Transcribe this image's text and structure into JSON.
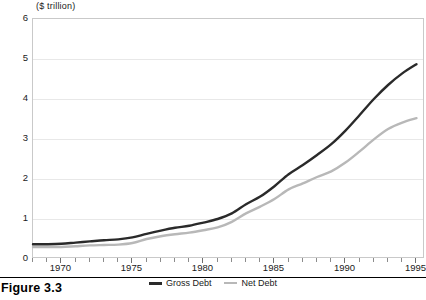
{
  "caption": "Figure 3.3",
  "chart_data": {
    "type": "line",
    "title": "",
    "subtitle": "",
    "xlabel": "",
    "ylabel": "($ trillion)",
    "y_unit_label": "($ trillion)",
    "xlim": [
      1968,
      1995.6
    ],
    "ylim": [
      0,
      6
    ],
    "y_ticks": [
      0,
      1,
      2,
      3,
      4,
      5,
      6
    ],
    "y_tick_labels": [
      "0",
      "1",
      "2",
      "3",
      "4",
      "5",
      "6"
    ],
    "x_ticks": [
      1970,
      1975,
      1980,
      1985,
      1990,
      1995
    ],
    "x_tick_labels": [
      "1970",
      "1975",
      "1980",
      "1985",
      "1990",
      "1995"
    ],
    "x_minor_tick_step": 1,
    "grid": "horizontal",
    "legend_position": "bottom-center",
    "x": [
      1968,
      1969,
      1970,
      1971,
      1972,
      1973,
      1974,
      1975,
      1976,
      1977,
      1978,
      1979,
      1980,
      1981,
      1982,
      1983,
      1984,
      1985,
      1986,
      1987,
      1988,
      1989,
      1990,
      1991,
      1992,
      1993,
      1994,
      1995
    ],
    "series": [
      {
        "name": "Gross Debt",
        "color": "#2a2a2a",
        "width": 2.4,
        "values": [
          0.37,
          0.37,
          0.38,
          0.41,
          0.44,
          0.47,
          0.49,
          0.54,
          0.63,
          0.71,
          0.78,
          0.83,
          0.91,
          1.0,
          1.14,
          1.37,
          1.56,
          1.82,
          2.12,
          2.35,
          2.6,
          2.87,
          3.21,
          3.6,
          4.0,
          4.35,
          4.64,
          4.87
        ]
      },
      {
        "name": "Net Debt",
        "color": "#b8b8b8",
        "width": 2.4,
        "values": [
          0.3,
          0.3,
          0.3,
          0.32,
          0.34,
          0.35,
          0.36,
          0.4,
          0.5,
          0.57,
          0.62,
          0.66,
          0.72,
          0.79,
          0.93,
          1.14,
          1.31,
          1.5,
          1.74,
          1.89,
          2.05,
          2.19,
          2.41,
          2.69,
          2.99,
          3.25,
          3.41,
          3.52
        ]
      }
    ]
  },
  "legend": {
    "entries": [
      {
        "label": "Gross Debt",
        "color": "#2a2a2a"
      },
      {
        "label": "Net Debt",
        "color": "#b8b8b8"
      }
    ]
  }
}
